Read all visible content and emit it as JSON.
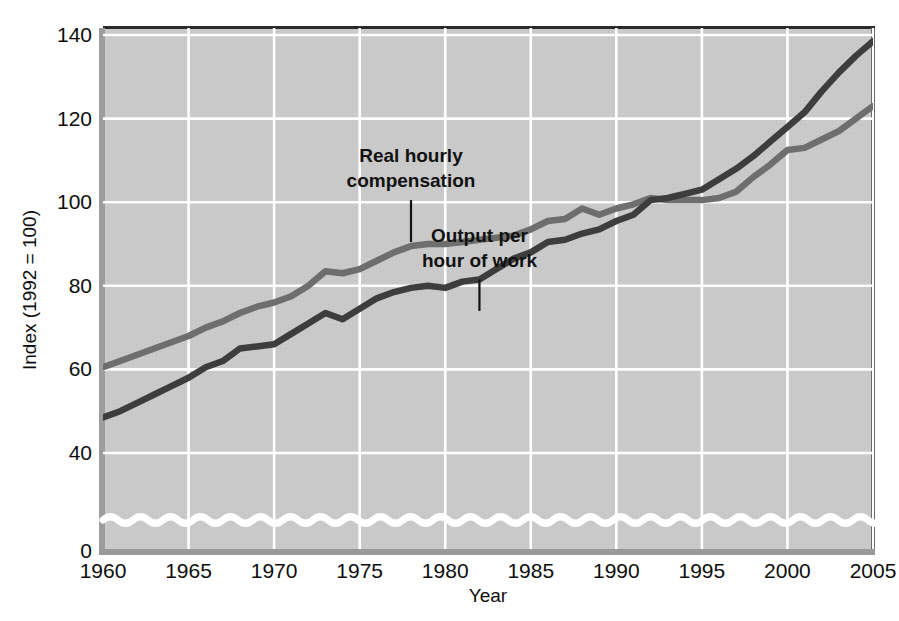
{
  "chart_data": {
    "type": "line",
    "title": "",
    "xlabel": "Year",
    "ylabel": "Index (1992 = 100)",
    "xlim": [
      1960,
      2005
    ],
    "ylim": [
      36,
      146
    ],
    "ylim_display": [
      0,
      146
    ],
    "y_axis_break": true,
    "grid": true,
    "legend": "annotated-inline",
    "background": "#c9c9c9",
    "xticks": [
      "1960",
      "1965",
      "1970",
      "1975",
      "1980",
      "1985",
      "1990",
      "1995",
      "2000",
      "2005"
    ],
    "xtick_values": [
      1960,
      1965,
      1970,
      1975,
      1980,
      1985,
      1990,
      1995,
      2000,
      2005
    ],
    "yticks": [
      "0",
      "40",
      "60",
      "80",
      "100",
      "120",
      "140"
    ],
    "ytick_values": [
      0,
      40,
      60,
      80,
      100,
      120,
      140
    ],
    "gridline_y_values": [
      40,
      60,
      80,
      100,
      120,
      140
    ],
    "series": [
      {
        "name": "Real hourly compensation",
        "color": "#6e6e6e",
        "x": [
          1960,
          1961,
          1962,
          1963,
          1964,
          1965,
          1966,
          1967,
          1968,
          1969,
          1970,
          1971,
          1972,
          1973,
          1974,
          1975,
          1976,
          1977,
          1978,
          1979,
          1980,
          1981,
          1982,
          1983,
          1984,
          1985,
          1986,
          1987,
          1988,
          1989,
          1990,
          1991,
          1992,
          1993,
          1994,
          1995,
          1996,
          1997,
          1998,
          1999,
          2000,
          2001,
          2002,
          2003,
          2004,
          2005
        ],
        "values": [
          60.5,
          62.0,
          63.5,
          65.0,
          66.5,
          68.0,
          70.0,
          71.5,
          73.5,
          75.0,
          76.0,
          77.5,
          80.0,
          83.5,
          83.0,
          84.0,
          86.0,
          88.0,
          89.5,
          90.0,
          90.0,
          90.5,
          91.0,
          91.5,
          92.0,
          93.5,
          95.5,
          96.0,
          98.5,
          97.0,
          98.5,
          99.5,
          101.0,
          100.5,
          100.5,
          100.5,
          101.0,
          102.5,
          106.0,
          109.0,
          112.5,
          113.0,
          115.0,
          117.0,
          120.0,
          123.0
        ]
      },
      {
        "name": "Output per hour of work",
        "color": "#3d3d3d",
        "x": [
          1960,
          1961,
          1962,
          1963,
          1964,
          1965,
          1966,
          1967,
          1968,
          1969,
          1970,
          1971,
          1972,
          1973,
          1974,
          1975,
          1976,
          1977,
          1978,
          1979,
          1980,
          1981,
          1982,
          1983,
          1984,
          1985,
          1986,
          1987,
          1988,
          1989,
          1990,
          1991,
          1992,
          1993,
          1994,
          1995,
          1996,
          1997,
          1998,
          1999,
          2000,
          2001,
          2002,
          2003,
          2004,
          2005
        ],
        "values": [
          48.5,
          50.0,
          52.0,
          54.0,
          56.0,
          58.0,
          60.5,
          62.0,
          65.0,
          65.5,
          66.0,
          68.5,
          71.0,
          73.5,
          72.0,
          74.5,
          77.0,
          78.5,
          79.5,
          80.0,
          79.5,
          81.0,
          81.5,
          84.0,
          86.5,
          88.0,
          90.5,
          91.0,
          92.5,
          93.5,
          95.5,
          97.0,
          100.5,
          101.0,
          102.0,
          103.0,
          105.5,
          108.0,
          111.0,
          114.5,
          118.0,
          121.5,
          126.5,
          131.0,
          135.0,
          138.5
        ]
      }
    ],
    "annotations": [
      {
        "label_line_1": "Real hourly",
        "label_line_2": "compensation",
        "text_anchor_x": 1978,
        "leader_from_y": 100.5,
        "leader_to_y": 90.5,
        "for_series": "Real hourly compensation"
      },
      {
        "label_line_1": "Output per",
        "label_line_2": "hour of work",
        "text_anchor_x": 1982,
        "leader_from_y": 81.5,
        "leader_to_y": 74.0,
        "for_series": "Output per hour of work"
      }
    ]
  }
}
